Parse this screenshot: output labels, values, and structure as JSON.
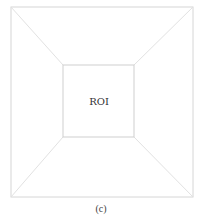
{
  "diagram": {
    "inner_label": "ROI",
    "caption": "(c)",
    "outer_square": {
      "x1": 11,
      "y1": 7,
      "x2": 193,
      "y2": 197
    },
    "inner_square": {
      "x1": 63,
      "y1": 65,
      "x2": 134,
      "y2": 137
    },
    "line_color": "#d8d8d8"
  }
}
